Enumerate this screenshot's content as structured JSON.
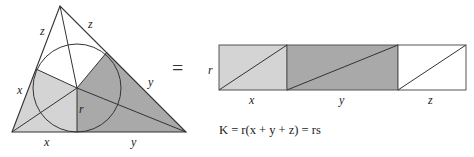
{
  "triangle": {
    "vertices": {
      "A": [
        60,
        6
      ],
      "B": [
        12,
        132
      ],
      "C": [
        186,
        132
      ]
    },
    "incenter": [
      77,
      88
    ],
    "inradius": 44,
    "tangent_points": {
      "AB": [
        36,
        69
      ],
      "AC": [
        107,
        52
      ],
      "BC": [
        77,
        132
      ]
    },
    "labels": {
      "z_left": "z",
      "z_right": "z",
      "x_left": "x",
      "y_right": "y",
      "x_bottom": "x",
      "y_bottom": "y",
      "r": "r"
    },
    "colors": {
      "x_region": "#d4d4d4",
      "y_region": "#a9a9a9",
      "z_region": "#ffffff",
      "stroke": "#333333"
    }
  },
  "equals_sign": "=",
  "rectangle": {
    "labels": {
      "r": "r",
      "x": "x",
      "y": "y",
      "z": "z"
    },
    "segments": [
      {
        "name": "x",
        "color": "#d4d4d4"
      },
      {
        "name": "y",
        "color": "#a9a9a9"
      },
      {
        "name": "z",
        "color": "#ffffff"
      }
    ]
  },
  "formula": {
    "text": "K = r(x + y + z) = rs"
  }
}
